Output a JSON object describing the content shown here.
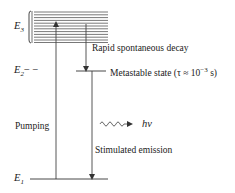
{
  "diagram": {
    "levels": [
      {
        "id": "E3",
        "symbol": "E",
        "subscript": "3",
        "kind": "band"
      },
      {
        "id": "E2",
        "symbol": "E",
        "subscript": "2",
        "suffix": "− −",
        "kind": "metastable"
      },
      {
        "id": "E1",
        "symbol": "E",
        "subscript": "1",
        "kind": "ground"
      }
    ],
    "labels": {
      "decay": "Rapid spontaneous decay",
      "metastable_prefix": "Metastable state (τ ≈ 10",
      "metastable_exp": "−3",
      "metastable_suffix": " s)",
      "pumping": "Pumping",
      "stimulated": "Stimulated emission",
      "photon": "hν"
    },
    "transitions": [
      {
        "from": "E1",
        "to": "E3",
        "label": "Pumping"
      },
      {
        "from": "E3",
        "to": "E2",
        "label": "Rapid spontaneous decay"
      },
      {
        "from": "E2",
        "to": "E1",
        "label": "Stimulated emission"
      }
    ],
    "colors": {
      "ink": "#333333",
      "band": "#555555"
    }
  }
}
